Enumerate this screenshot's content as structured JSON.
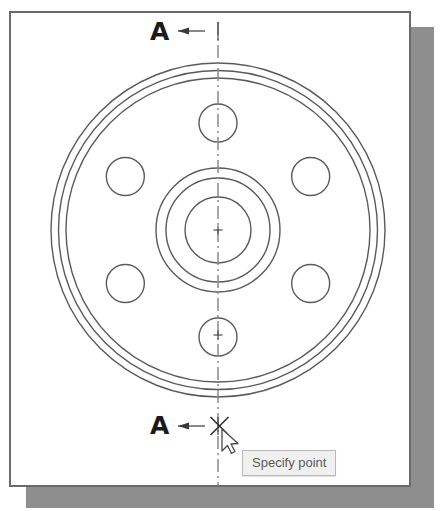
{
  "app": {
    "type": "cad-drawing-viewport",
    "background_color": "#ffffff",
    "sheet_border_color": "#6a6a6a",
    "shadow_color": "#8e8e8e",
    "line_color": "#5a5a5a",
    "centerline_color": "#8a8a8a"
  },
  "drawing": {
    "title": "Circular flange plate - section view setup",
    "section_label_top": "A",
    "section_label_bottom": "A",
    "center": {
      "x": 218,
      "y": 230
    },
    "outer_rings_radii": [
      167,
      159.5,
      152
    ],
    "hub_circles_radii": [
      62,
      52,
      33
    ],
    "bolt_circle_radius": 107,
    "bolt_hole_radius": 19,
    "bolt_hole_angles_deg": [
      90,
      30,
      -30,
      -90,
      -150,
      150
    ],
    "center_marks": [
      {
        "x": 218,
        "y": 230,
        "size": 9
      },
      {
        "x": 218,
        "y": 335,
        "size": 9
      }
    ],
    "section_line": {
      "x": 218,
      "y_top": 22,
      "y_bottom": 485,
      "style": "dashed-centerline"
    },
    "section_arrows": [
      {
        "label": "A",
        "y": 31,
        "x_tail": 205,
        "x_head": 178,
        "direction": "left"
      },
      {
        "label": "A",
        "y": 426,
        "x_tail": 205,
        "x_head": 178,
        "direction": "left"
      }
    ]
  },
  "cursor": {
    "name": "arrow-pointer",
    "x": 222,
    "y": 429,
    "snap_marker": {
      "name": "snap-x-marker",
      "x": 219.5,
      "y": 426,
      "size": 18
    }
  },
  "tooltip": {
    "text": "Specify point",
    "x": 242,
    "y": 450,
    "background": "#f0f0f0",
    "border_color": "#b9b9b9",
    "text_color": "#5a5a5a"
  }
}
